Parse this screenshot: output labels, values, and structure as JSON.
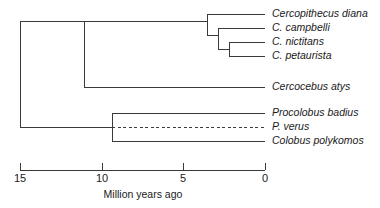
{
  "figure": {
    "type": "phylogenetic-tree",
    "background_color": "#ffffff",
    "line_color": "#3a3a3a",
    "text_color": "#1a1a1a"
  },
  "axis": {
    "title": "Million years ago",
    "unit": "Million years ago",
    "direction": "reversed",
    "min": 0,
    "max": 15,
    "ticks": [
      {
        "value": 15,
        "label": "15",
        "x": 20
      },
      {
        "value": 10,
        "label": "10",
        "x": 101.7
      },
      {
        "value": 5,
        "label": "5",
        "x": 183.3
      },
      {
        "value": 0,
        "label": "0",
        "x": 265
      }
    ],
    "axis_y": 170,
    "tick_length": 7,
    "pixels_per_my": 16.333,
    "x_at_zero": 265
  },
  "taxa": [
    {
      "id": "cercopithecus-diana",
      "label": "Cercopithecus diana",
      "row_y": 14
    },
    {
      "id": "c-campbelli",
      "label": "C. campbelli",
      "row_y": 28
    },
    {
      "id": "c-nictitans",
      "label": "C. nictitans",
      "row_y": 42
    },
    {
      "id": "c-petaurista",
      "label": "C. petaurista",
      "row_y": 56
    },
    {
      "id": "cercocebus-atys",
      "label": "Cercocebus atys",
      "row_y": 87
    },
    {
      "id": "procolobus-badius",
      "label": "Procolobus badius",
      "row_y": 113
    },
    {
      "id": "p-verus",
      "label": "P. verus",
      "row_y": 127,
      "branch_style": "dashed"
    },
    {
      "id": "colobus-polykomos",
      "label": "Colobus polykomos",
      "row_y": 141
    }
  ],
  "nodes": [
    {
      "id": "root",
      "x": 20,
      "age_my": 15.0,
      "y_top": 21,
      "y_bottom": 128
    },
    {
      "id": "cercopithecinae",
      "x": 84,
      "age_my": 11.1,
      "y_top": 21,
      "y_bottom": 87
    },
    {
      "id": "colobinae",
      "x": 112,
      "age_my": 9.4,
      "y_top": 113,
      "y_bottom": 141
    },
    {
      "id": "cercopithecus-clade",
      "x": 207,
      "age_my": 3.6,
      "y_top": 14,
      "y_bottom": 35
    },
    {
      "id": "cercopithecus-subclade-1",
      "x": 218,
      "age_my": 2.9,
      "y_top": 28,
      "y_bottom": 49
    },
    {
      "id": "cercopithecus-subclade-2",
      "x": 229,
      "age_my": 2.2,
      "y_top": 42,
      "y_bottom": 56
    }
  ],
  "labels": {
    "label_x": 272,
    "tip_x": 265
  }
}
